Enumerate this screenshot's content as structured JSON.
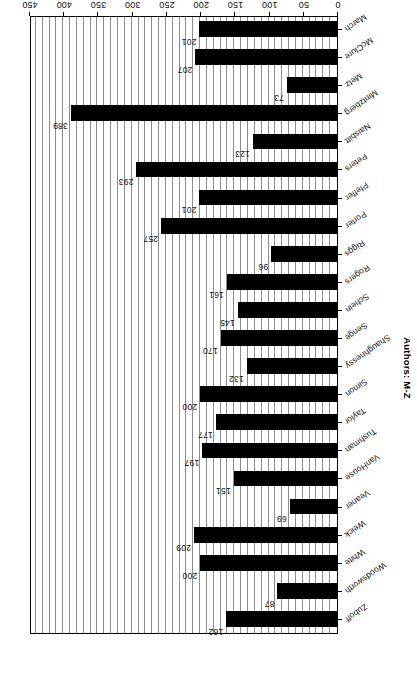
{
  "chart_data": {
    "type": "bar",
    "orientation": "horizontal",
    "title": "",
    "xlabel": "Total co-citations",
    "ylabel": "Authors: M-Z",
    "xlim": [
      0,
      450
    ],
    "xticks": [
      0,
      50,
      100,
      150,
      200,
      250,
      300,
      350,
      400,
      450
    ],
    "grid": true,
    "legend": null,
    "page_rotation_degrees": 180,
    "bar_color": "#000000",
    "gridline_color": "#8d8d8d",
    "axis_color": "#000000",
    "categories": [
      "March",
      "McClure",
      "Metz",
      "Mintzberg",
      "Naisbitt",
      "Peters",
      "Pfeffer",
      "Porter",
      "Riggs",
      "Rogers",
      "Schein",
      "Senge",
      "Shaughnessy",
      "Simon",
      "Taylor",
      "Tushman",
      "VanHouse",
      "Veaner",
      "Weick",
      "White",
      "Woodsworth",
      "Zuboff"
    ],
    "values": [
      201,
      207,
      73,
      389,
      123,
      293,
      201,
      257,
      96,
      161,
      145,
      170,
      132,
      200,
      177,
      197,
      151,
      69,
      209,
      200,
      87,
      162
    ],
    "data_labels": [
      "201",
      "207",
      "73",
      "389",
      "123",
      "293",
      "201",
      "257",
      "96",
      "161",
      "145",
      "170",
      "132",
      "200",
      "177",
      "197",
      "151",
      "69",
      "209",
      "200",
      "87",
      "162"
    ],
    "xtick_labels": [
      "0",
      "50",
      "100",
      "150",
      "200",
      "250",
      "300",
      "350",
      "400",
      "450"
    ]
  }
}
